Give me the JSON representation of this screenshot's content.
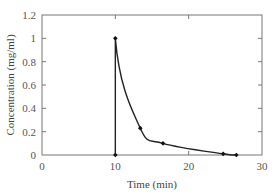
{
  "chart_data": {
    "type": "line",
    "title": "",
    "xlabel": "Time (min)",
    "ylabel": "Concentration (mg/ml)",
    "xlim": [
      0,
      30
    ],
    "ylim": [
      0,
      1.2
    ],
    "grid": false,
    "legend": null,
    "x_ticks": [
      0,
      10,
      20,
      30
    ],
    "x_tick_labels": [
      "0",
      "10",
      "20",
      "30"
    ],
    "y_ticks": [
      0,
      0.2,
      0.4,
      0.6,
      0.8,
      1.0,
      1.2
    ],
    "y_tick_labels": [
      "0",
      "0.2",
      "0.4",
      "0.6",
      "0.8",
      "1",
      "1.2"
    ],
    "series": [
      {
        "name": "Concentration",
        "color": "#222222",
        "marker": "diamond",
        "x": [
          10,
          10,
          13.4,
          16.5,
          24.7,
          26.5
        ],
        "y": [
          0,
          1.0,
          0.23,
          0.1,
          0.01,
          0.0
        ]
      }
    ]
  },
  "labels": {
    "xlabel": "Time (min)",
    "ylabel": "Concentration (mg/ml)",
    "xticks": [
      "0",
      "10",
      "20",
      "30"
    ],
    "yticks": [
      "0",
      "0.2",
      "0.4",
      "0.6",
      "0.8",
      "1",
      "1.2"
    ]
  }
}
